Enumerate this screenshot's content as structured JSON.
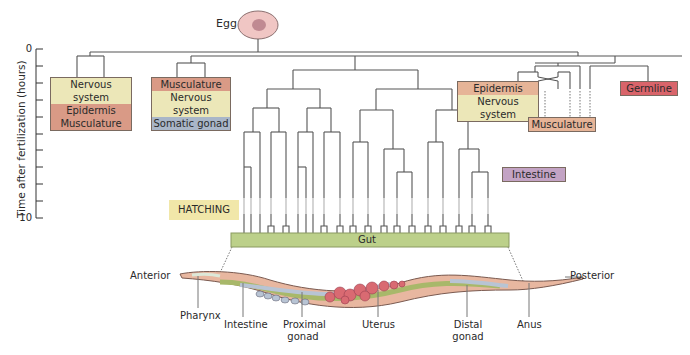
{
  "axis": {
    "title": "Time after fertilization (hours)",
    "ticks": {
      "start": "0",
      "end": "10"
    },
    "range": [
      0,
      10
    ]
  },
  "egg": {
    "label": "Egg"
  },
  "lineages": {
    "group1": {
      "rows": [
        "Nervous system",
        "Epidermis",
        "Musculature"
      ],
      "colors": [
        "#ece7b8",
        "#d99a86",
        "#d99a86"
      ]
    },
    "group2": {
      "rows": [
        "Musculature",
        "Nervous system",
        "Somatic gonad"
      ],
      "colors": [
        "#d99a86",
        "#ece7b8",
        "#a9b6c8"
      ]
    },
    "group3": {
      "rows": [
        "Epidermis",
        "Nervous system"
      ],
      "colors": [
        "#e6b497",
        "#ece7b8"
      ]
    },
    "group4": {
      "label": "Musculature",
      "color": "#e6b497"
    },
    "germline": {
      "label": "Germline",
      "color": "#d9646a"
    },
    "intestine": {
      "label": "Intestine",
      "color": "#c3a3c4"
    },
    "gut": {
      "label": "Gut",
      "color": "#bcd08a"
    }
  },
  "hatching": {
    "label": "HATCHING",
    "color": "#f1e7a9"
  },
  "worm": {
    "anterior": "Anterior",
    "posterior": "Posterior",
    "parts": [
      {
        "label": "Pharynx"
      },
      {
        "label": "Intestine"
      },
      {
        "label": "Proximal gonad"
      },
      {
        "label": "Uterus"
      },
      {
        "label": "Distal gonad"
      },
      {
        "label": "Anus"
      }
    ]
  }
}
